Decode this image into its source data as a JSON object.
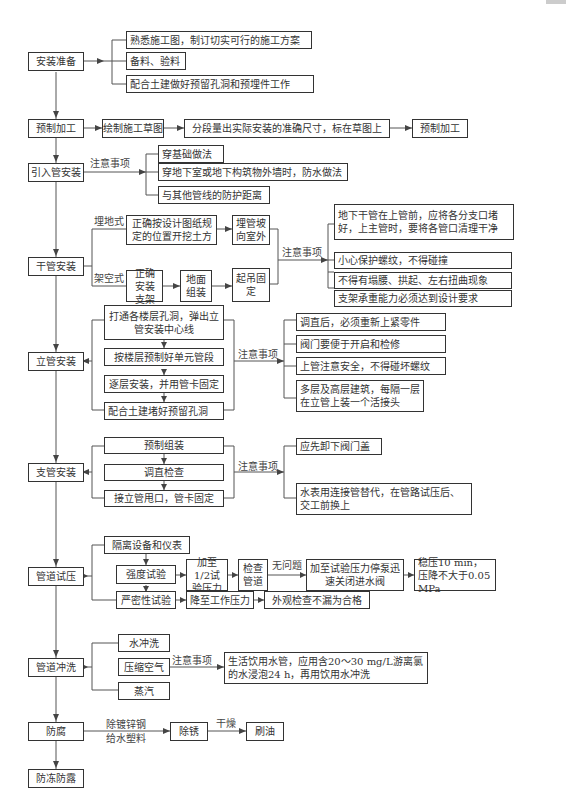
{
  "diagram": {
    "type": "flowchart",
    "main_steps": [
      "安装准备",
      "预制加工",
      "引入管安装",
      "干管安装",
      "立管安装",
      "支管安装",
      "管道试压",
      "管道冲洗",
      "防腐",
      "防冻防露"
    ],
    "prep": {
      "label": "安装准备",
      "items": [
        "熟悉施工图，制订切实可行的施工方案",
        "备料、验料",
        "配合土建做好预留孔洞和预埋件工作"
      ]
    },
    "prefab": {
      "label": "预制加工",
      "steps": [
        "绘制施工草图",
        "分段量出实际安装的准确尺寸，标在草图上",
        "预制加工"
      ]
    },
    "inlet": {
      "label": "引入管安装",
      "note_label": "注意事项",
      "items": [
        "穿基础做法",
        "穿地下室或地下构筑物外墙时，防水做法",
        "与其他管线的防护距离"
      ]
    },
    "main_pipe": {
      "label": "干管安装",
      "buried_label": "埋地式",
      "buried_steps": [
        "正确按设计图纸规定的位置开挖土方",
        "埋管坡向室外"
      ],
      "overhead_label": "架空式",
      "overhead_steps": [
        "正确安装支架",
        "地面组装",
        "起吊固定"
      ],
      "note_label": "注意事项",
      "items": [
        "地下干管在上管前，应将各分支口堵好，上主管时，要将各管口清理干净",
        "小心保护螺纹，不得碰撞",
        "不得有塌腰、拱起、左右扭曲现象",
        "支架承重能力必须达到设计要求"
      ]
    },
    "riser": {
      "label": "立管安装",
      "steps": [
        "打通各楼层孔洞，弹出立管安装中心线",
        "按楼层预制好单元管段",
        "逐层安装，并用管卡固定",
        "配合土建堵好预留孔洞"
      ],
      "note_label": "注意事项",
      "items": [
        "调直后，必须重新上紧零件",
        "阀门要便于开启和检修",
        "上管注意安全，不得碰坏螺纹",
        "多层及高层建筑，每隔一层在立管上装一个活接头"
      ]
    },
    "branch": {
      "label": "支管安装",
      "steps": [
        "预制组装",
        "调直检查",
        "接立管甩口，管卡固定"
      ],
      "note_label": "注意事项",
      "items": [
        "应先卸下阀门盖",
        "水表用连接管替代，在管路试压后、交工前换上"
      ]
    },
    "pressure": {
      "label": "管道试压",
      "isolate": "隔离设备和仪表",
      "strength": "强度试验",
      "strength_steps": [
        "加至1/2试验压力",
        "检查管道"
      ],
      "ok_label": "无问题",
      "strength_final": [
        "加至试验压力停泵迅速关闭进水阀",
        "稳压10 min，压降不大于0.05 MPa"
      ],
      "tightness": "严密性试验",
      "tightness_steps": [
        "降至工作压力",
        "外观检查不漏为合格"
      ]
    },
    "flush": {
      "label": "管道冲洗",
      "methods": [
        "水冲洗",
        "压缩空气",
        "蒸汽"
      ],
      "note_label": "注意事项",
      "note": "生活饮用水管，应用含20～30 mg/L游离氯的水浸泡24 h，再用饮用水冲洗"
    },
    "anticorrosion": {
      "label": "防腐",
      "cond_line1": "除镀锌钢",
      "cond_line2": "给水塑料",
      "step1": "除锈",
      "dry_label": "干燥",
      "step2": "刷油"
    },
    "frost": {
      "label": "防冻防露"
    }
  }
}
